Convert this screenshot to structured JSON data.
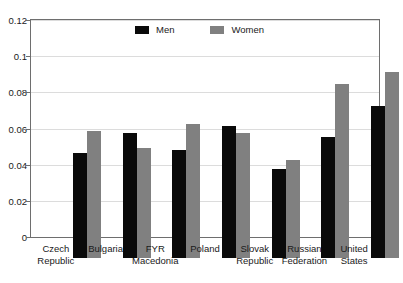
{
  "chart_data": {
    "type": "bar",
    "title": "",
    "subtitle": "",
    "xlabel": "",
    "ylabel": "",
    "ylim": [
      0,
      0.12
    ],
    "yticks": [
      "0",
      "0.02",
      "0.04",
      "0.06",
      "0.08",
      "0.1",
      "0.12"
    ],
    "ytick_values": [
      0,
      0.02,
      0.04,
      0.06,
      0.08,
      0.1,
      0.12
    ],
    "grid": true,
    "legend_position": "top-center",
    "categories": [
      "Czech\nRepublic",
      "Bulgaria",
      "FYR\nMacedonia",
      "Poland",
      "Slovak\nRepublic",
      "Russian\nFederation",
      "United\nStates"
    ],
    "series": [
      {
        "name": "Men",
        "color": "#0a0a0a",
        "values": [
          0.058,
          0.069,
          0.06,
          0.073,
          0.049,
          0.067,
          0.084
        ]
      },
      {
        "name": "Women",
        "color": "#808080",
        "values": [
          0.07,
          0.061,
          0.074,
          0.069,
          0.054,
          0.096,
          0.103
        ]
      }
    ]
  },
  "legend": {
    "items": [
      {
        "label": "Men",
        "color": "#0a0a0a"
      },
      {
        "label": "Women",
        "color": "#808080"
      }
    ]
  },
  "axis": {
    "y_max": 0.12,
    "y_min": 0
  }
}
